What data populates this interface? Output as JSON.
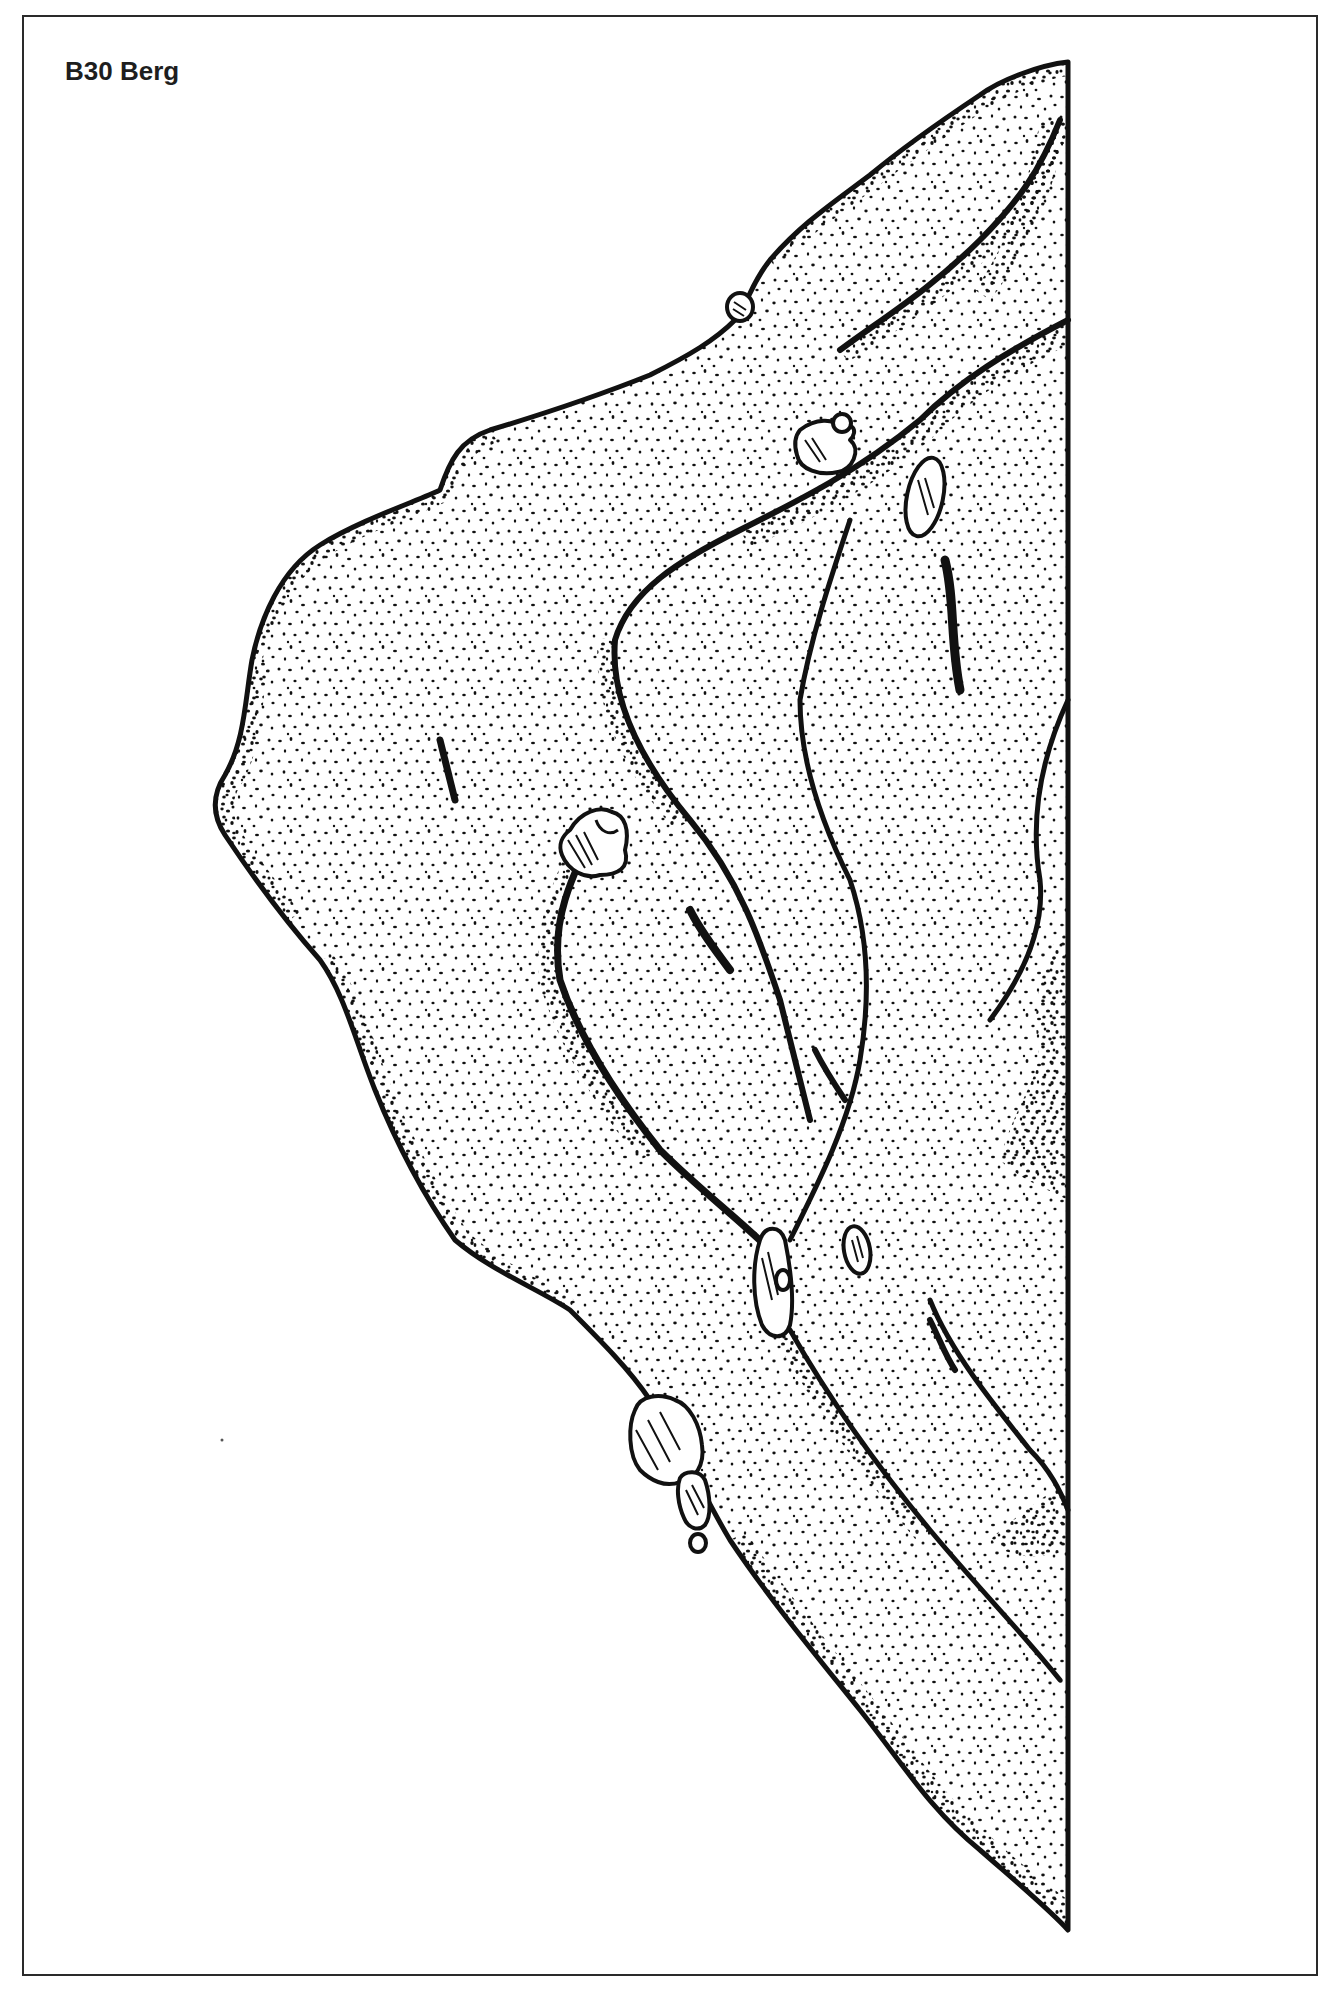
{
  "page": {
    "title": "B30 Berg"
  },
  "illustration": {
    "subject": "stippled ink drawing of a rock face / boulder",
    "ink_color": "#111111",
    "paper_color": "#ffffff",
    "frame_color": "#2a2a2a",
    "boulders": [
      {
        "name": "pebble-top"
      },
      {
        "name": "boulder-upper-middle"
      },
      {
        "name": "boulder-upper-right"
      },
      {
        "name": "boulder-middle-left"
      },
      {
        "name": "boulder-lower-middle"
      },
      {
        "name": "boulder-lower-right"
      },
      {
        "name": "boulder-bottom-large"
      },
      {
        "name": "boulder-bottom-small"
      },
      {
        "name": "boulder-bottom-tiny"
      }
    ]
  }
}
